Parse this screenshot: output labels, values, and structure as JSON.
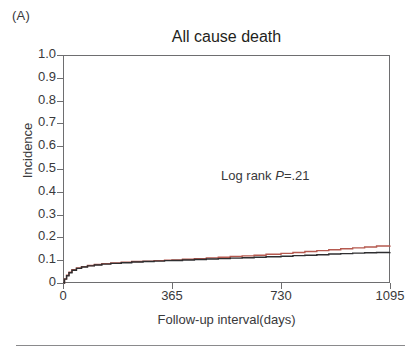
{
  "panel": {
    "letter": "(A)"
  },
  "chart_data": {
    "type": "line",
    "title": "All cause death",
    "xlabel": "Follow-up interval(days)",
    "ylabel": "Incidence",
    "xlim": [
      0,
      1095
    ],
    "ylim": [
      0,
      1.0
    ],
    "grid": false,
    "legend": "none",
    "xticks": [
      0,
      365,
      730,
      1095
    ],
    "xtick_labels": [
      "0",
      "365",
      "730",
      "1095"
    ],
    "yticks": [
      0,
      0.1,
      0.2,
      0.3,
      0.4,
      0.5,
      0.6,
      0.7,
      0.8,
      0.9,
      1.0
    ],
    "ytick_labels": [
      "0",
      "0.1",
      "0.2",
      "0.3",
      "0.4",
      "0.5",
      "0.6",
      "0.7",
      "0.8",
      "0.9",
      "1.0"
    ],
    "annotations": [
      {
        "name": "log-rank-p-value",
        "prefix": "Log rank ",
        "stat_symbol": "P",
        "value_text": "=.21",
        "x": 700,
        "y": 0.44
      }
    ],
    "series": [
      {
        "name": "group-2",
        "color": "#b5594f",
        "style": "step",
        "x": [
          0,
          5,
          12,
          20,
          30,
          45,
          62,
          82,
          105,
          130,
          160,
          195,
          230,
          268,
          305,
          340,
          365,
          400,
          440,
          480,
          520,
          560,
          600,
          640,
          680,
          730,
          770,
          810,
          850,
          890,
          930,
          970,
          1010,
          1050,
          1095
        ],
        "y": [
          0.0,
          0.018,
          0.034,
          0.047,
          0.058,
          0.066,
          0.072,
          0.077,
          0.081,
          0.085,
          0.088,
          0.091,
          0.094,
          0.096,
          0.098,
          0.1,
          0.101,
          0.104,
          0.107,
          0.11,
          0.113,
          0.116,
          0.119,
          0.122,
          0.126,
          0.13,
          0.134,
          0.138,
          0.142,
          0.146,
          0.15,
          0.154,
          0.158,
          0.162,
          0.165
        ]
      },
      {
        "name": "group-1",
        "color": "#2e2e30",
        "style": "step",
        "x": [
          0,
          5,
          12,
          20,
          30,
          45,
          62,
          82,
          105,
          130,
          160,
          195,
          230,
          268,
          305,
          340,
          365,
          400,
          440,
          480,
          520,
          560,
          600,
          640,
          680,
          730,
          770,
          810,
          850,
          890,
          930,
          970,
          1010,
          1050,
          1095
        ],
        "y": [
          0.0,
          0.017,
          0.032,
          0.045,
          0.056,
          0.064,
          0.07,
          0.075,
          0.079,
          0.083,
          0.086,
          0.089,
          0.092,
          0.094,
          0.096,
          0.098,
          0.099,
          0.101,
          0.103,
          0.105,
          0.107,
          0.109,
          0.111,
          0.113,
          0.115,
          0.117,
          0.12,
          0.122,
          0.124,
          0.127,
          0.129,
          0.131,
          0.133,
          0.134,
          0.135
        ]
      }
    ]
  },
  "colors": {
    "axis": "#6e6e70",
    "text": "#39393b",
    "series_red": "#b5594f",
    "series_black": "#2e2e30",
    "rule": "#8a8a8c"
  }
}
